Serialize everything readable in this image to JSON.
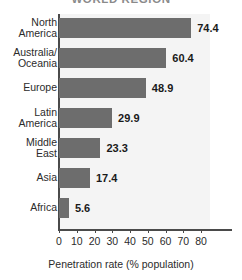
{
  "chart_data": {
    "type": "bar",
    "orientation": "horizontal",
    "title": "WORLD REGION",
    "xlabel": "Penetration rate (% population)",
    "ylabel": "",
    "xlim": [
      0,
      85
    ],
    "xticks": [
      0,
      10,
      20,
      30,
      40,
      50,
      60,
      70,
      80
    ],
    "xtick_labels": [
      "0",
      "10",
      "20",
      "30",
      "40",
      "50",
      "60",
      "70",
      "80"
    ],
    "grid": false,
    "legend": null,
    "bar_color": "#6d6d6d",
    "plot_background": "#f4f4f4",
    "categories": [
      "North\nAmerica",
      "Australia/\nOceania",
      "Europe",
      "Latin\nAmerica",
      "Middle\nEast",
      "Asia",
      "Africa"
    ],
    "values": [
      74.4,
      60.4,
      48.9,
      29.9,
      23.3,
      17.4,
      5.6
    ],
    "value_labels": [
      "74.4",
      "60.4",
      "48.9",
      "29.9",
      "23.3",
      "17.4",
      "5.6"
    ]
  }
}
